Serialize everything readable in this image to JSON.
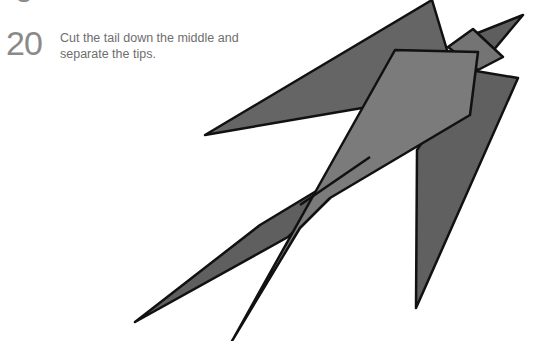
{
  "previous_step": {
    "number": "9"
  },
  "step": {
    "number": "20",
    "text": "Cut the tail down the middle and separate the tips."
  },
  "figure": {
    "fill_dark": "#626262",
    "fill_light": "#7a7a7a",
    "stroke": "#111111"
  }
}
